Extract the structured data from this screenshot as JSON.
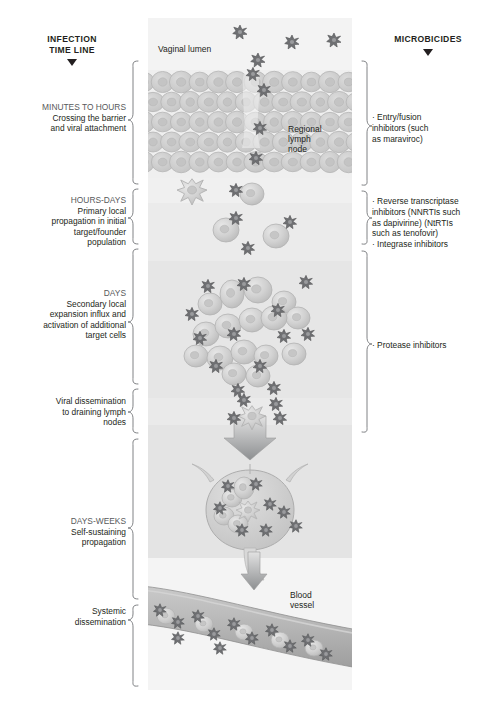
{
  "headers": {
    "left_title_line1": "INFECTION",
    "left_title_line2": "TIME LINE",
    "right_title": "MICROBICIDES",
    "left_arrow_icon": "down-triangle-icon",
    "right_arrow_icon": "down-triangle-icon"
  },
  "timeline": [
    {
      "id": "minutes-to-hours",
      "heading": "MINUTES TO HOURS",
      "lines": [
        "Crossing the barrier",
        "and viral attachment"
      ]
    },
    {
      "id": "hours-days",
      "heading": "HOURS-DAYS",
      "lines": [
        "Primary local",
        "propagation in initial",
        "target/founder",
        "population"
      ]
    },
    {
      "id": "days",
      "heading": "DAYS",
      "lines": [
        "Secondary local",
        "expansion influx and",
        "activation of additional",
        "target cells"
      ]
    },
    {
      "id": "viral-dissemination",
      "heading": "",
      "lines": [
        "Viral dissemination",
        "to draining lymph",
        "nodes"
      ]
    },
    {
      "id": "days-weeks",
      "heading": "DAYS-WEEKS",
      "lines": [
        "Self-sustaining",
        "propagation"
      ]
    },
    {
      "id": "systemic-dissemination",
      "heading": "",
      "lines": [
        "Systemic",
        "dissemination"
      ]
    }
  ],
  "microbicides": [
    {
      "id": "entry-fusion",
      "lines": [
        "· Entry/fusion",
        "inhibitors (such",
        "as maraviroc)"
      ]
    },
    {
      "id": "reverse-transcriptase",
      "lines": [
        "· Reverse transcriptase",
        "inhibitors (NNRTIs such",
        "as dapivirine) (NtRTIs",
        "such as tenofovir)",
        "· Integrase inhibitors"
      ]
    },
    {
      "id": "protease",
      "lines": [
        "· Protease inhibitors"
      ]
    }
  ],
  "illustration_labels": {
    "vaginal_lumen": "Vaginal lumen",
    "regional_lymph_node": "Regional\nlymph\nnode",
    "regional_lymph_node_lines": [
      "Regional",
      "lymph",
      "node"
    ],
    "blood_vessel_lines": [
      "Blood",
      "vessel"
    ]
  },
  "colors": {
    "text": "#231f20",
    "muted_text": "#58595b",
    "bracket": "#808285",
    "cell_fill": "#cfcfcf",
    "cell_stroke": "#b6b6b6",
    "virion": "#6d6e71",
    "panel_bg": "#f2f2f2",
    "page_bg": "#ffffff"
  },
  "caption": {
    "text": ""
  }
}
